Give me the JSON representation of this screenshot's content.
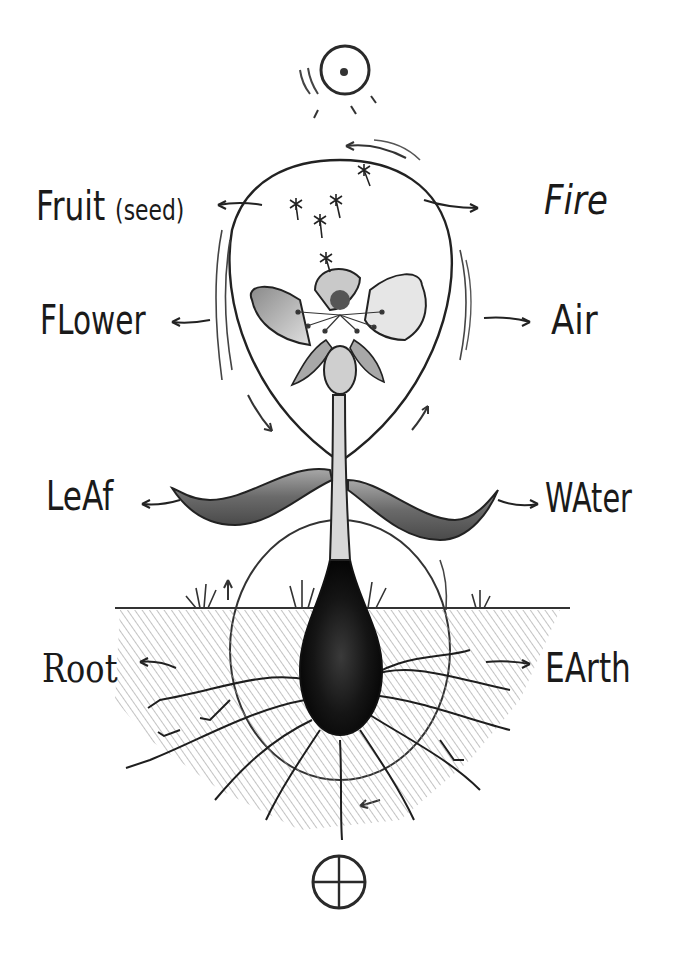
{
  "diagram": {
    "style": "hand-drawn pencil sketch",
    "top_symbol": {
      "name": "sun",
      "glyph": "circle-with-dot"
    },
    "bottom_symbol": {
      "name": "earth",
      "glyph": "circle-with-cross"
    },
    "left_labels": [
      {
        "id": "fruit",
        "text": "Fruit",
        "note": "(seed)"
      },
      {
        "id": "flower",
        "text": "FLower"
      },
      {
        "id": "leaf",
        "text": "LeAf"
      },
      {
        "id": "root",
        "text": "Root"
      }
    ],
    "right_labels": [
      {
        "id": "fire",
        "text": "Fire"
      },
      {
        "id": "air",
        "text": "Air"
      },
      {
        "id": "water",
        "text": "WAter"
      },
      {
        "id": "earth",
        "text": "EArth"
      }
    ],
    "correspondences": [
      {
        "plant_part": "Fruit (seed)",
        "element": "Fire"
      },
      {
        "plant_part": "Flower",
        "element": "Air"
      },
      {
        "plant_part": "Leaf",
        "element": "Water"
      },
      {
        "plant_part": "Root",
        "element": "Earth"
      }
    ],
    "colors": {
      "ink": "#1a1a1a",
      "shade": "#6e6e6e",
      "light_shade": "#bdbdbd",
      "background": "#ffffff"
    }
  }
}
